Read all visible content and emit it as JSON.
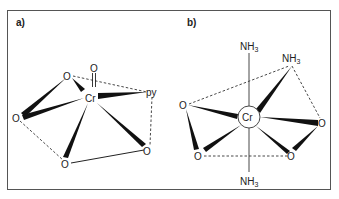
{
  "figure": {
    "panels": [
      {
        "id": "a",
        "label": "a)",
        "metal": "Cr",
        "atoms": {
          "oxo": "O",
          "o_top": "O",
          "o_left": "O",
          "o_bottom": "O",
          "o_right": "O",
          "ligand": "py"
        }
      },
      {
        "id": "b",
        "label": "b)",
        "metal": "Cr",
        "atoms": {
          "nh3_top": "NH",
          "nh3_right": "NH",
          "nh3_bottom": "NH",
          "nh3_sub": "3",
          "o_left": "O",
          "o_right": "O",
          "o_bottom_left": "O",
          "o_bottom_right": "O"
        }
      }
    ]
  }
}
